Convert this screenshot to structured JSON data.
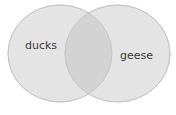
{
  "venn": {
    "sets": [
      {
        "label": "ducks",
        "fill": "#e4e4e4",
        "stroke": "#cfcfcf"
      },
      {
        "label": "geese",
        "fill": "#e4e4e4",
        "stroke": "#cfcfcf"
      }
    ],
    "overlap_fill": "#d3d3d3",
    "text_color": "#3a3a3a"
  }
}
